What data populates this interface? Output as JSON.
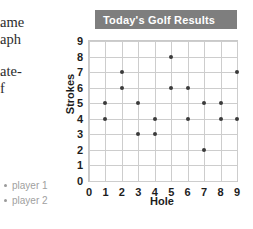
{
  "margin_text": {
    "line1": "ame",
    "line2": "aph",
    "line3": "ate-",
    "line4": "f"
  },
  "legend": {
    "items": [
      {
        "label": "player 1",
        "marker": "bullet-dot"
      },
      {
        "label": "player 2",
        "marker": "bullet-dot"
      }
    ]
  },
  "colors": {
    "title_bar": "#7e7e7e",
    "title_text": "#ffffff",
    "grid": "#cdcdcd",
    "dot": "#3a3a3a",
    "legend_text": "#a0a0a0"
  },
  "chart_data": {
    "type": "scatter",
    "title": "Today's Golf Results",
    "xlabel": "Hole",
    "ylabel": "Strokes",
    "xlim": [
      0,
      9
    ],
    "ylim": [
      0,
      9
    ],
    "xticks": [
      0,
      1,
      2,
      3,
      4,
      5,
      6,
      7,
      8,
      9
    ],
    "yticks": [
      0,
      1,
      2,
      3,
      4,
      5,
      6,
      7,
      8,
      9
    ],
    "grid": true,
    "legend_position": "outside-left-bottom",
    "series": [
      {
        "name": "player 1",
        "x": [
          1,
          2,
          3,
          4,
          5,
          6,
          7,
          8,
          9
        ],
        "values": [
          5,
          7,
          5,
          4,
          8,
          6,
          5,
          5,
          7
        ]
      },
      {
        "name": "player 2",
        "x": [
          1,
          2,
          3,
          4,
          5,
          6,
          7,
          8,
          9
        ],
        "values": [
          4,
          6,
          3,
          3,
          6,
          4,
          2,
          4,
          4
        ]
      }
    ],
    "points": [
      {
        "hole": 1,
        "strokes": 5
      },
      {
        "hole": 1,
        "strokes": 4
      },
      {
        "hole": 2,
        "strokes": 7
      },
      {
        "hole": 2,
        "strokes": 6
      },
      {
        "hole": 3,
        "strokes": 5
      },
      {
        "hole": 3,
        "strokes": 3
      },
      {
        "hole": 4,
        "strokes": 4
      },
      {
        "hole": 4,
        "strokes": 3
      },
      {
        "hole": 5,
        "strokes": 8
      },
      {
        "hole": 5,
        "strokes": 6
      },
      {
        "hole": 6,
        "strokes": 6
      },
      {
        "hole": 6,
        "strokes": 4
      },
      {
        "hole": 7,
        "strokes": 5
      },
      {
        "hole": 7,
        "strokes": 2
      },
      {
        "hole": 8,
        "strokes": 5
      },
      {
        "hole": 8,
        "strokes": 4
      },
      {
        "hole": 9,
        "strokes": 7
      },
      {
        "hole": 9,
        "strokes": 4
      }
    ]
  }
}
